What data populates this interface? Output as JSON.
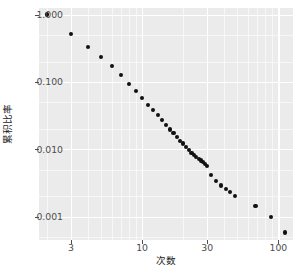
{
  "chart_data": {
    "type": "scatter",
    "title": "",
    "xlabel": "次数",
    "ylabel": "累积比率",
    "xscale": "log",
    "yscale": "log",
    "xlim": [
      1.75,
      128
    ],
    "ylim": [
      0.00045,
      1.25
    ],
    "grid": true,
    "legend": false,
    "point_color": "#111111",
    "panel_background": "#EBEBEB",
    "grid_color": "#FFFFFF",
    "x_ticks": [
      {
        "value": 3,
        "label": "3"
      },
      {
        "value": 10,
        "label": "10"
      },
      {
        "value": 30,
        "label": "30"
      },
      {
        "value": 100,
        "label": "100"
      }
    ],
    "y_ticks": [
      {
        "value": 1.0,
        "label": "1.000"
      },
      {
        "value": 0.1,
        "label": "0.100"
      },
      {
        "value": 0.01,
        "label": "0.010"
      },
      {
        "value": 0.001,
        "label": "0.001"
      }
    ],
    "x_minor_ticks": [
      2,
      4,
      5,
      6,
      7,
      8,
      9,
      20,
      40,
      50,
      60,
      70,
      80,
      90
    ],
    "y_minor_ticks": [
      0.5,
      0.2,
      0.05,
      0.02,
      0.005,
      0.002,
      0.0005
    ],
    "points": [
      [
        2,
        1.0
      ],
      [
        3,
        0.52
      ],
      [
        4,
        0.33
      ],
      [
        5,
        0.235
      ],
      [
        6,
        0.172
      ],
      [
        7,
        0.128
      ],
      [
        8,
        0.094
      ],
      [
        9,
        0.074
      ],
      [
        10,
        0.057
      ],
      [
        11,
        0.0455
      ],
      [
        12,
        0.0385
      ],
      [
        13,
        0.0322
      ],
      [
        14,
        0.0272
      ],
      [
        15,
        0.0232
      ],
      [
        16,
        0.0197
      ],
      [
        17,
        0.0172
      ],
      [
        18,
        0.0152
      ],
      [
        19,
        0.0134
      ],
      [
        20,
        0.0122
      ],
      [
        21,
        0.0108
      ],
      [
        22,
        0.0098
      ],
      [
        23,
        0.0089
      ],
      [
        24,
        0.0082
      ],
      [
        25,
        0.0076
      ],
      [
        26,
        0.0071
      ],
      [
        27,
        0.0068
      ],
      [
        28,
        0.0064
      ],
      [
        29,
        0.0061
      ],
      [
        30,
        0.0057
      ],
      [
        32,
        0.0042
      ],
      [
        35,
        0.0034
      ],
      [
        38,
        0.0029
      ],
      [
        41,
        0.0026
      ],
      [
        44,
        0.0023
      ],
      [
        48,
        0.002
      ],
      [
        68,
        0.00145
      ],
      [
        88,
        0.001
      ],
      [
        112,
        0.00058
      ]
    ]
  }
}
